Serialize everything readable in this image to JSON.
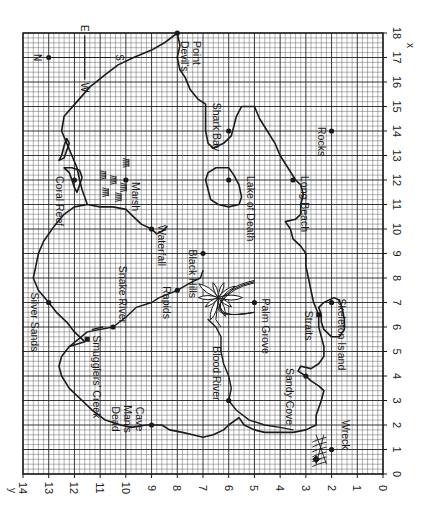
{
  "map": {
    "title": "Treasure Island grid map",
    "axes": {
      "x_label": "x",
      "y_label": "y",
      "x_ticks": [
        0,
        1,
        2,
        3,
        4,
        5,
        6,
        7,
        8,
        9,
        10,
        11,
        12,
        13,
        14,
        15,
        16,
        17,
        18
      ],
      "y_ticks": [
        0,
        1,
        2,
        3,
        4,
        5,
        6,
        7,
        8,
        9,
        10,
        11,
        12,
        13,
        14
      ],
      "x_range": [
        0,
        18
      ],
      "y_range": [
        0,
        14
      ],
      "minor_divisions_per_unit": 5
    },
    "compass": {
      "north": "N",
      "south": "S",
      "east": "E",
      "west": "W"
    },
    "landmarks": [
      {
        "name": "Devil's Point",
        "lines": [
          "Devil's",
          "Point"
        ],
        "x": 18,
        "y": 8
      },
      {
        "name": "Shark Bay",
        "lines": [
          "Shark Bay"
        ],
        "x": 14,
        "y": 6
      },
      {
        "name": "Rocks",
        "lines": [
          "Rocks"
        ],
        "x": 14,
        "y": 2
      },
      {
        "name": "Coral Reef",
        "lines": [
          "Coral Reef"
        ],
        "x": 12,
        "y": 12
      },
      {
        "name": "Marsh",
        "lines": [
          "Marsh"
        ],
        "x": 12,
        "y": 10
      },
      {
        "name": "Lake of Death",
        "lines": [
          "Lake of Death"
        ],
        "x": 12,
        "y": 6
      },
      {
        "name": "Long Beach",
        "lines": [
          "Long Beach"
        ],
        "x": 12,
        "y": 3.5
      },
      {
        "name": "Waterfall",
        "lines": [
          "Waterfall"
        ],
        "x": 10,
        "y": 9
      },
      {
        "name": "Black Hills",
        "lines": [
          "Black Hills"
        ],
        "x": 9,
        "y": 7
      },
      {
        "name": "Rapids",
        "lines": [
          "Rapids"
        ],
        "x": 7.5,
        "y": 8
      },
      {
        "name": "Palm Grove",
        "lines": [
          "Palm Grove"
        ],
        "x": 7,
        "y": 5
      },
      {
        "name": "Silver Sands",
        "lines": [
          "Silver Sands"
        ],
        "x": 7,
        "y": 13
      },
      {
        "name": "Skeleton Island",
        "lines": [
          "Skeleton Island"
        ],
        "x": 7,
        "y": 2
      },
      {
        "name": "Straits",
        "lines": [
          "Straits"
        ],
        "x": 6.5,
        "y": 2.5
      },
      {
        "name": "Snake River",
        "lines": [
          "Snake River"
        ],
        "x": 6,
        "y": 10.5
      },
      {
        "name": "Smugglers' Creek",
        "lines": [
          "Smugglers' Creek"
        ],
        "x": 5.5,
        "y": 11.5
      },
      {
        "name": "Sandy Cove",
        "lines": [
          "Sandy Cove"
        ],
        "x": 4,
        "y": 3
      },
      {
        "name": "Blood River",
        "lines": [
          "Blood River"
        ],
        "x": 3,
        "y": 6
      },
      {
        "name": "Dead Man's Cave",
        "lines": [
          "Dead",
          "Man's",
          "Cave"
        ],
        "x": 2,
        "y": 9
      },
      {
        "name": "Wreck",
        "lines": [
          "Wreck"
        ],
        "x": 1,
        "y": 2
      }
    ],
    "colors": {
      "ink": "#1a1a1a",
      "grid_minor": "#555555",
      "grid_major": "#222222",
      "background": "#ffffff"
    }
  }
}
